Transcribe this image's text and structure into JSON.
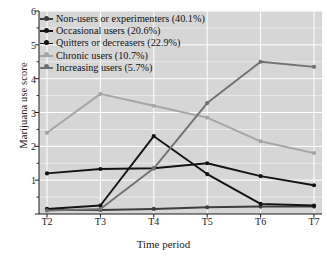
{
  "chart_data": {
    "type": "line",
    "title": "",
    "subtitle": "",
    "xlabel": "Time period",
    "ylabel": "Marijuana use score",
    "categories": [
      "T2",
      "T3",
      "T4",
      "T5",
      "T6",
      "T7"
    ],
    "x": [
      2,
      3,
      4,
      5,
      6,
      7
    ],
    "ylim": [
      0,
      6
    ],
    "xlim": [
      1.6,
      7.4
    ],
    "yticks": [
      0,
      1,
      2,
      3,
      4,
      5,
      6
    ],
    "ytick_labels": [
      "",
      "1",
      "2",
      "3",
      "4",
      "5",
      "6"
    ],
    "yminorticks": [
      0.5,
      1.5,
      2.5,
      3.5,
      4.5,
      5.5
    ],
    "grid": "horizontal and vertical white gridlines on light-gray panel",
    "legend_position": "upper left, inside plot area",
    "marker": "filled circle",
    "series": [
      {
        "name": "Non-users or experimenters (40.1%)",
        "label": "Non-users or experimenters",
        "percent": "40.1%",
        "color": "#3d3d3d",
        "values": [
          0.12,
          0.12,
          0.15,
          0.2,
          0.22,
          0.22
        ]
      },
      {
        "name": "Occasional users (20.6%)",
        "label": "Occasional users",
        "percent": "20.6%",
        "color": "#131313",
        "values": [
          1.2,
          1.33,
          1.35,
          1.5,
          1.12,
          0.85
        ]
      },
      {
        "name": "Quitters or decreasers (22.9%)",
        "label": "Quitters or decreasers",
        "percent": "22.9%",
        "color": "#131313",
        "values": [
          0.15,
          0.25,
          2.3,
          1.18,
          0.3,
          0.25
        ]
      },
      {
        "name": "Chronic users (10.7%)",
        "label": "Chronic users",
        "percent": "10.7%",
        "color": "#a5a5a5",
        "values": [
          2.4,
          3.55,
          3.2,
          2.85,
          2.15,
          1.8
        ]
      },
      {
        "name": "Increasing users (5.7%)",
        "label": "Increasing users",
        "percent": "5.7%",
        "color": "#727272",
        "values": [
          0.1,
          0.15,
          1.35,
          3.28,
          4.5,
          4.35
        ]
      }
    ]
  },
  "legend": {
    "items": [
      "Non-users or experimenters (40.1%)",
      "Occasional users (20.6%)",
      "Quitters or decreasers (22.9%)",
      "Chronic users (10.7%)",
      "Increasing users (5.7%)"
    ]
  },
  "axes": {
    "y_title": "Marijuana use score",
    "x_title": "Time period"
  },
  "style": {
    "panel_bg": "#d6d6d6",
    "grid_color": "#ffffff",
    "axis_color": "#1a1a1a",
    "page_bg": "#ffffff"
  }
}
